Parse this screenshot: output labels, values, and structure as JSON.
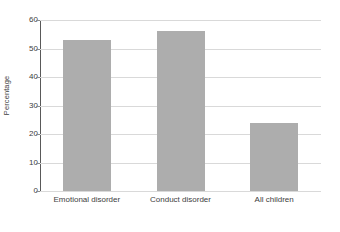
{
  "chart_data": {
    "type": "bar",
    "title": "",
    "subtitle": "",
    "xlabel": "",
    "ylabel": "Percentage",
    "categories": [
      "Emotional disorder",
      "Conduct disorder",
      "All children"
    ],
    "values": [
      53,
      56,
      24
    ],
    "series": [
      {
        "name": "Percentage",
        "values": [
          53,
          56,
          24
        ]
      }
    ],
    "ylim": [
      0,
      60
    ],
    "y_ticks": [
      0,
      10,
      20,
      30,
      40,
      50,
      60
    ],
    "y_tick_labels": [
      "0",
      "10",
      "20",
      "30",
      "40",
      "50",
      "60"
    ],
    "grid": "horizontal",
    "legend": "none",
    "annotations": [],
    "colors": {
      "bar_fill": "#adadad",
      "gridline": "#d9d9d9",
      "axis_line": "#595959",
      "tick_mark": "#8c8c8c",
      "text": "#404040",
      "background": "#ffffff"
    }
  }
}
